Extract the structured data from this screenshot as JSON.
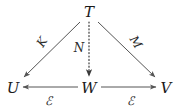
{
  "figure": {
    "type": "commutative-diagram",
    "background_color": "#ffffff",
    "stroke_color": "#555555",
    "text_color": "#1a1a1a"
  },
  "nodes": [
    {
      "id": "T",
      "label": "T",
      "x": 89,
      "y": 12
    },
    {
      "id": "U",
      "label": "U",
      "x": 13,
      "y": 88
    },
    {
      "id": "W",
      "label": "W",
      "x": 89,
      "y": 88
    },
    {
      "id": "V",
      "label": "V",
      "x": 166,
      "y": 88
    }
  ],
  "edges": [
    {
      "id": "T-to-U",
      "from": "T",
      "to": "U",
      "style": "solid",
      "label": "K",
      "label_x": 42,
      "label_y": 42,
      "label_rotation": "rot-left"
    },
    {
      "id": "T-to-W",
      "from": "T",
      "to": "W",
      "style": "dotted",
      "label": "N",
      "label_x": 79,
      "label_y": 48,
      "label_rotation": "upright"
    },
    {
      "id": "T-to-V",
      "from": "T",
      "to": "V",
      "style": "solid",
      "label": "M",
      "label_x": 136,
      "label_y": 42,
      "label_rotation": "rot-right"
    },
    {
      "id": "W-to-U",
      "from": "W",
      "to": "U",
      "style": "solid",
      "label": "ℰ",
      "label_x": 48,
      "label_y": 101,
      "label_rotation": "upright"
    },
    {
      "id": "W-to-V",
      "from": "W",
      "to": "V",
      "style": "solid",
      "label": "ℰ",
      "label_x": 130,
      "label_y": 101,
      "label_rotation": "upright"
    }
  ]
}
